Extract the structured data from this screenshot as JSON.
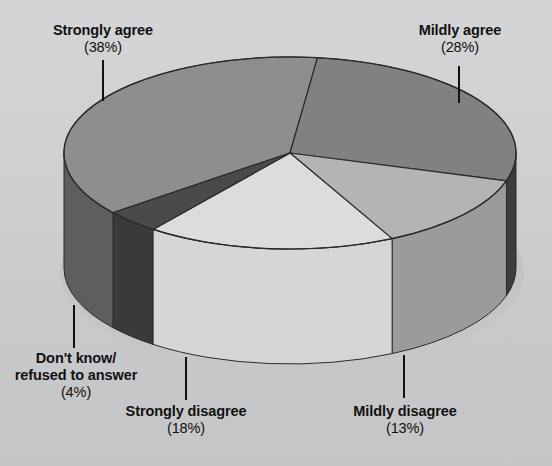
{
  "chart_data": {
    "type": "pie",
    "title": "",
    "subtitle": "",
    "xlabel": "",
    "ylabel": "",
    "legend_position": "none",
    "grid": false,
    "three_d": true,
    "background_color": "#c9cacb",
    "categories": [
      "Strongly agree",
      "Mildly agree",
      "Mildly disagree",
      "Strongly disagree",
      "Don't know/ refused to answer"
    ],
    "values": [
      38,
      28,
      13,
      18,
      4
    ],
    "value_unit": "%",
    "slices": [
      {
        "label": "Strongly agree",
        "label_line1": "Strongly agree",
        "label_line2": "",
        "value": 38,
        "percent_text": "(38%)",
        "top_color": "#8e8e8e",
        "side_color": "#5e5e5e"
      },
      {
        "label": "Mildly agree",
        "label_line1": "Mildly agree",
        "label_line2": "",
        "value": 28,
        "percent_text": "(28%)",
        "top_color": "#818181",
        "side_color": "#3c3c3c"
      },
      {
        "label": "Mildly disagree",
        "label_line1": "Mildly disagree",
        "label_line2": "",
        "value": 13,
        "percent_text": "(13%)",
        "top_color": "#b4b4b4",
        "side_color": "#919191"
      },
      {
        "label": "Strongly disagree",
        "label_line1": "Strongly disagree",
        "label_line2": "",
        "value": 18,
        "percent_text": "(18%)",
        "top_color": "#dcdcdc",
        "side_color": "#d2d2d2"
      },
      {
        "label": "Don't know/ refused to answer",
        "label_line1": "Don't know/",
        "label_line2": "refused to answer",
        "value": 4,
        "percent_text": "(4%)",
        "top_color": "#4a4a4a",
        "side_color": "#3a3a3a"
      }
    ]
  },
  "outline_color": "#2b2b2b",
  "leader_line_color": "#111111"
}
